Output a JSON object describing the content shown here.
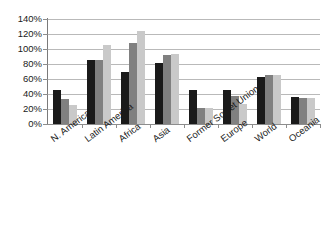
{
  "chart_data": {
    "type": "bar",
    "title": "",
    "subtitle": "",
    "xlabel": "",
    "ylabel": "",
    "categories": [
      "N. America",
      "Latin America",
      "Africa",
      "Asia",
      "Former Soviet Union",
      "Europe",
      "World",
      "Oceania"
    ],
    "series": [
      {
        "name": "series-1",
        "color": "#1a1a1a",
        "values": [
          45,
          86,
          70,
          81,
          45,
          45,
          63,
          36
        ]
      },
      {
        "name": "series-2",
        "color": "#808080",
        "values": [
          34,
          86,
          108,
          92,
          22,
          38,
          65,
          35
        ]
      },
      {
        "name": "series-3",
        "color": "#c9c9c9",
        "values": [
          26,
          105,
          124,
          93,
          22,
          27,
          66,
          35
        ]
      }
    ],
    "ylim": [
      0,
      140
    ],
    "ytick_values": [
      0,
      20,
      40,
      60,
      80,
      100,
      120,
      140
    ],
    "ytick_labels": [
      "0%",
      "20%",
      "40%",
      "60%",
      "80%",
      "100%",
      "120%",
      "140%"
    ],
    "grid": true,
    "grid_axis": "y",
    "legend": false,
    "legend_position": "none",
    "value_suffix": "%"
  }
}
